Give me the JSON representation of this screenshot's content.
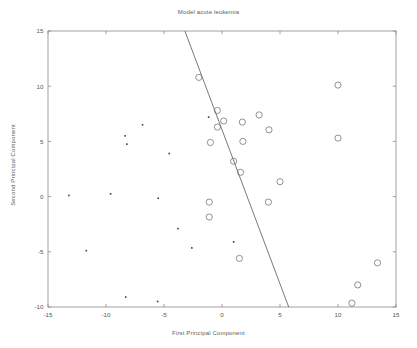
{
  "figure": {
    "title": "Model acute leukemia",
    "background_color": "#ffffff",
    "axis_color": "#8a8a8a",
    "text_color": "#5e5e5e"
  },
  "chart_data": {
    "type": "scatter",
    "title": "Model acute leukemia",
    "xlabel": "First Principal Component",
    "ylabel": "Second Principal Component",
    "xlim": [
      -15,
      15
    ],
    "ylim": [
      -10,
      15
    ],
    "xticks": [
      -15,
      -10,
      -5,
      0,
      5,
      10,
      15
    ],
    "yticks": [
      -10,
      -5,
      0,
      5,
      10,
      15
    ],
    "xtick_labels": [
      "-15",
      "-10",
      "-5",
      "0",
      "5",
      "10",
      "15"
    ],
    "ytick_labels": [
      "-10",
      "-5",
      "0",
      "5",
      "10",
      "15"
    ],
    "grid": false,
    "legend": null,
    "series": [
      {
        "name": "group-dot",
        "marker": "dot",
        "marker_size": 1.6,
        "color": "#3d3d3d",
        "points": [
          [
            -13.2,
            0.1
          ],
          [
            -11.7,
            -4.9
          ],
          [
            -9.6,
            0.25
          ],
          [
            -8.35,
            5.5
          ],
          [
            -8.2,
            4.75
          ],
          [
            -8.3,
            -9.1
          ],
          [
            -6.85,
            6.5
          ],
          [
            -5.5,
            -0.15
          ],
          [
            -5.55,
            -9.5
          ],
          [
            -4.55,
            3.9
          ],
          [
            -3.8,
            -2.9
          ],
          [
            -2.6,
            -4.65
          ],
          [
            -1.15,
            7.2
          ],
          [
            1.0,
            -4.1
          ]
        ]
      },
      {
        "name": "group-circle",
        "marker": "circle",
        "marker_size": 3.1,
        "color": "#6e6e6e",
        "points": [
          [
            -2.0,
            10.8
          ],
          [
            10.0,
            10.1
          ],
          [
            -0.4,
            7.8
          ],
          [
            0.15,
            6.85
          ],
          [
            -0.4,
            6.3
          ],
          [
            1.75,
            6.75
          ],
          [
            3.2,
            7.4
          ],
          [
            4.05,
            6.05
          ],
          [
            -1.0,
            4.9
          ],
          [
            1.8,
            5.0
          ],
          [
            10.0,
            5.3
          ],
          [
            1.0,
            3.2
          ],
          [
            1.6,
            2.2
          ],
          [
            5.0,
            1.35
          ],
          [
            -1.1,
            -0.5
          ],
          [
            4.0,
            -0.5
          ],
          [
            -1.1,
            -1.85
          ],
          [
            1.5,
            -5.6
          ],
          [
            13.4,
            -6.0
          ],
          [
            11.7,
            -8.0
          ],
          [
            11.2,
            -9.65
          ]
        ]
      }
    ],
    "annotations": [
      {
        "name": "decision-boundary",
        "type": "line",
        "from": [
          -3.2,
          15.0
        ],
        "to": [
          5.75,
          -10.0
        ],
        "color": "#6a6a6a",
        "width": 0.9
      }
    ]
  }
}
